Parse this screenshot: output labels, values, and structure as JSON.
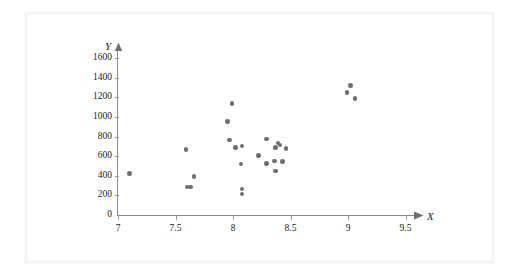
{
  "figure": {
    "background_color": "#ffffff",
    "frame_color": "#ededed",
    "marker_color": "#6e6e6e",
    "axis_color": "#8a8a8a",
    "x_axis_title": "X",
    "y_axis_title": "Y"
  },
  "chart_data": {
    "type": "scatter",
    "title": "",
    "subtitle": "",
    "xlabel": "X",
    "ylabel": "Y",
    "xlim": [
      7,
      9.5
    ],
    "ylim": [
      0,
      1600
    ],
    "xticks": [
      7,
      7.5,
      8,
      8.5,
      9,
      9.5
    ],
    "xtick_labels": [
      "7",
      "7.5",
      "8",
      "8.5",
      "9",
      "9.5"
    ],
    "yticks": [
      0,
      200,
      400,
      600,
      800,
      1000,
      1200,
      1400,
      1600
    ],
    "ytick_labels": [
      "0",
      "200",
      "400",
      "600",
      "800",
      "1000",
      "1200",
      "1400",
      "1600"
    ],
    "grid": false,
    "legend": null,
    "legend_position": "none",
    "annotations": [],
    "marker": "circle",
    "marker_size": 5,
    "series": [
      {
        "name": "observations",
        "color": "#6e6e6e",
        "points": [
          {
            "x": 7.1,
            "y": 425
          },
          {
            "x": 7.59,
            "y": 670
          },
          {
            "x": 7.6,
            "y": 285
          },
          {
            "x": 7.63,
            "y": 285
          },
          {
            "x": 7.66,
            "y": 390
          },
          {
            "x": 7.95,
            "y": 955
          },
          {
            "x": 7.99,
            "y": 1140
          },
          {
            "x": 7.97,
            "y": 765
          },
          {
            "x": 8.02,
            "y": 690
          },
          {
            "x": 8.08,
            "y": 705
          },
          {
            "x": 8.07,
            "y": 520
          },
          {
            "x": 8.08,
            "y": 265
          },
          {
            "x": 8.08,
            "y": 215
          },
          {
            "x": 8.22,
            "y": 605
          },
          {
            "x": 8.29,
            "y": 775
          },
          {
            "x": 8.29,
            "y": 525
          },
          {
            "x": 8.37,
            "y": 690
          },
          {
            "x": 8.39,
            "y": 735
          },
          {
            "x": 8.41,
            "y": 715
          },
          {
            "x": 8.36,
            "y": 550
          },
          {
            "x": 8.43,
            "y": 548
          },
          {
            "x": 8.37,
            "y": 450
          },
          {
            "x": 8.46,
            "y": 680
          },
          {
            "x": 8.99,
            "y": 1250
          },
          {
            "x": 9.02,
            "y": 1320
          },
          {
            "x": 9.06,
            "y": 1190
          }
        ]
      }
    ]
  },
  "geometry": {
    "origin_px": {
      "x": 118,
      "y": 215
    },
    "x_unit_px": 115,
    "y_unit_px_per_200": 19.6
  }
}
